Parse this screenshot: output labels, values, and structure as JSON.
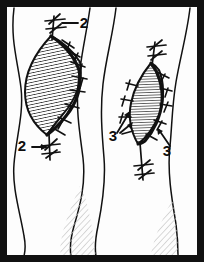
{
  "figure": {
    "background_color": "#ffffff",
    "ink_color": "#111111",
    "hatch_color": "#1a1a1a",
    "shadow_hatch_color": "#b9b9b9",
    "border": {
      "color": "#111111",
      "thickness_px": 7,
      "inner_background": "#fdfdfd"
    },
    "canvas": {
      "width": 204,
      "height": 262
    }
  },
  "labels": [
    {
      "id": "label-2-top",
      "text": "2",
      "x": 84,
      "y": 28,
      "leader": "horizontal line from numeral leftward to suture knot at apex of left wound",
      "points_to": "top-suture-knot-left-wound"
    },
    {
      "id": "label-2-bottom",
      "text": "2",
      "x": 22,
      "y": 151,
      "leader": "arrow pointing right to suture knot at lower pole of left wound",
      "points_to": "bottom-suture-knot-left-wound"
    },
    {
      "id": "label-3-left",
      "text": "3",
      "x": 113,
      "y": 141,
      "leader": "two arrows pointing up-right to lateral sutures of right wound",
      "points_to": "lateral-sutures-right-wound"
    },
    {
      "id": "label-3-right",
      "text": "3",
      "x": 167,
      "y": 156,
      "leader": "arrow pointing up-left to lateral suture of right wound",
      "points_to": "lateral-suture-right-wound"
    }
  ],
  "wounds": [
    {
      "id": "left-wound",
      "shape": "lens",
      "fill": "dense-curved-hatching",
      "suture_side": "right margin",
      "suture_count": 7,
      "knots": [
        "apex-top",
        "apex-bottom"
      ]
    },
    {
      "id": "right-wound",
      "shape": "lens-narrow",
      "fill": "vertical-hatching",
      "suture_side": "both margins",
      "suture_count": 8,
      "knots": [
        "apex-top",
        "apex-bottom"
      ]
    }
  ],
  "contours": [
    {
      "id": "limb-contour-left",
      "description": "wavy vertical body outline at left"
    },
    {
      "id": "limb-contour-center-a",
      "description": "wavy vertical body outline left of centre"
    },
    {
      "id": "limb-contour-center-b",
      "description": "wavy vertical body outline right of centre"
    },
    {
      "id": "limb-contour-right",
      "description": "wavy vertical body outline at right"
    }
  ],
  "shadows": [
    {
      "id": "shadow-lower-left",
      "description": "lightly hatched muscle shadow, lower-left quadrant"
    },
    {
      "id": "shadow-lower-right",
      "description": "lightly hatched muscle shadow, lower-right quadrant"
    }
  ]
}
